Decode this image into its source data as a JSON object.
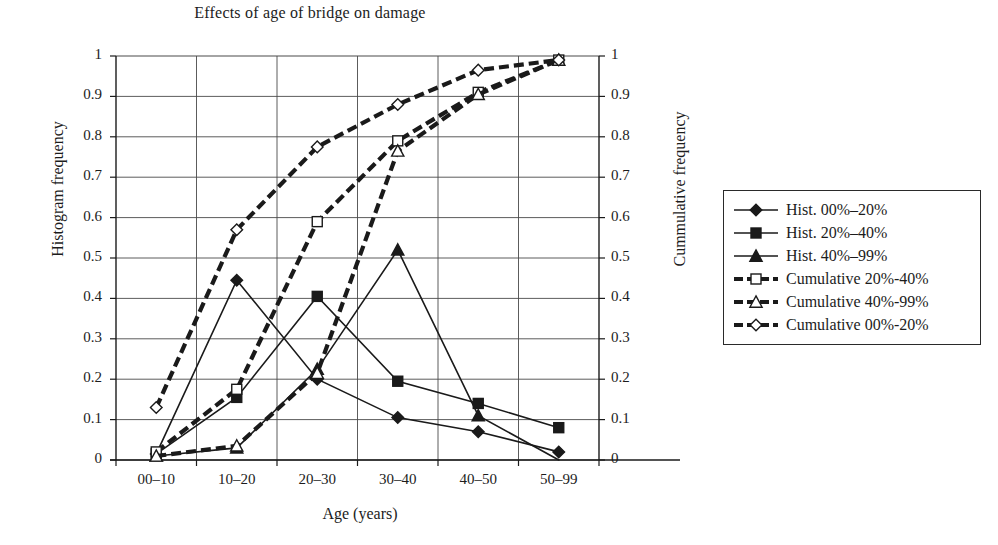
{
  "chart_data": {
    "type": "line",
    "title": "Effects of age of bridge on damage",
    "xlabel": "Age (years)",
    "ylabel": "Histogram frequency",
    "ylabel_right": "Cummulative frequency",
    "categories": [
      "00–10",
      "10–20",
      "20–30",
      "30–40",
      "40–50",
      "50–99"
    ],
    "ylim": [
      0,
      1
    ],
    "ylim_right": [
      0,
      1
    ],
    "ytick_labels": [
      "0",
      "0.1",
      "0.2",
      "0.3",
      "0.4",
      "0.5",
      "0.6",
      "0.7",
      "0.8",
      "0.9",
      "1"
    ],
    "ytick_values": [
      0,
      0.1,
      0.2,
      0.3,
      0.4,
      0.5,
      0.6,
      0.7,
      0.8,
      0.9,
      1
    ],
    "ytick_labels_right": [
      "0",
      "0.1",
      "0.2",
      "0.3",
      "0.4",
      "0.5",
      "0.6",
      "0.7",
      "0.8",
      "0.9",
      "1"
    ],
    "grid": true,
    "legend_position": "right-outside",
    "series": [
      {
        "name": "Hist. 00%–20%",
        "axis": "left",
        "style": "solid",
        "marker": "filled-diamond",
        "color": "#1a1a1a",
        "values": [
          0.015,
          0.445,
          0.2,
          0.105,
          0.07,
          0.02
        ]
      },
      {
        "name": "Hist. 20%–40%",
        "axis": "left",
        "style": "solid",
        "marker": "filled-square",
        "color": "#1a1a1a",
        "values": [
          0.015,
          0.155,
          0.405,
          0.195,
          0.14,
          0.08
        ]
      },
      {
        "name": "Hist. 40%–99%",
        "axis": "left",
        "style": "solid",
        "marker": "filled-triangle",
        "color": "#1a1a1a",
        "values": [
          0.01,
          0.03,
          0.225,
          0.52,
          0.11,
          0.0
        ]
      },
      {
        "name": "Cumulative 20%-40%",
        "axis": "right",
        "style": "dashed",
        "marker": "open-square",
        "color": "#1a1a1a",
        "values": [
          0.02,
          0.175,
          0.59,
          0.79,
          0.91,
          0.99
        ]
      },
      {
        "name": "Cumulative 40%-99%",
        "axis": "right",
        "style": "dashed",
        "marker": "open-triangle",
        "color": "#1a1a1a",
        "values": [
          0.01,
          0.035,
          0.215,
          0.765,
          0.905,
          0.99
        ]
      },
      {
        "name": "Cumulative 00%-20%",
        "axis": "right",
        "style": "dashed",
        "marker": "open-diamond",
        "color": "#1a1a1a",
        "values": [
          0.13,
          0.57,
          0.775,
          0.88,
          0.965,
          0.99
        ]
      }
    ]
  },
  "legend": {
    "items": [
      {
        "label": "Hist. 00%–20%",
        "marker": "filled-diamond",
        "style": "solid"
      },
      {
        "label": "Hist. 20%–40%",
        "marker": "filled-square",
        "style": "solid"
      },
      {
        "label": "Hist. 40%–99%",
        "marker": "filled-triangle",
        "style": "solid"
      },
      {
        "label": "Cumulative 20%-40%",
        "marker": "open-square",
        "style": "dashed"
      },
      {
        "label": "Cumulative 40%-99%",
        "marker": "open-triangle",
        "style": "dashed"
      },
      {
        "label": "Cumulative 00%-20%",
        "marker": "open-diamond",
        "style": "dashed"
      }
    ]
  }
}
